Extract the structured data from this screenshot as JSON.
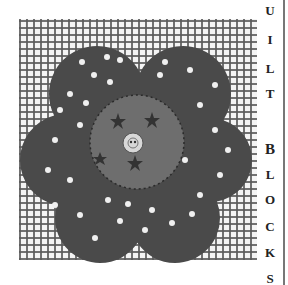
{
  "page": {
    "side_title_letters": [
      "U",
      "I",
      "L",
      "T",
      "",
      "B",
      "L",
      "O",
      "C",
      "K",
      "S"
    ],
    "side_title_text": "UILT BLOCKS"
  },
  "illustration": {
    "subject": "quilt block with polka-dot flower appliqué",
    "background": "gray plaid / gingham grid",
    "flower_color": "#4a4a4a",
    "center_color": "#6e6e6e",
    "button_color": "#d8d8d8",
    "dot_color": "#f0f0f0"
  }
}
